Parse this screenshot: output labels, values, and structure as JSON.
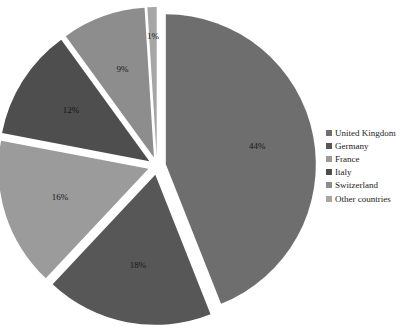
{
  "chart_data": {
    "type": "pie",
    "title": "",
    "xlabel": "",
    "ylabel": "",
    "legend_position": "right",
    "exploded": true,
    "categories": [
      "United Kingdom",
      "Germany",
      "France",
      "Italy",
      "Switzerland",
      "Other countries"
    ],
    "values": [
      44,
      18,
      16,
      12,
      9,
      1
    ],
    "data_labels": [
      "44%",
      "18%",
      "16%",
      "12%",
      "9%",
      "1%"
    ],
    "units": "percent",
    "colors": [
      "#6e6e6e",
      "#575757",
      "#9b9b9b",
      "#4e4e4e",
      "#8d8d8d",
      "#a6a6a6"
    ],
    "slices": [
      {
        "label": "United Kingdom",
        "value": 44,
        "data_label": "44%",
        "color": "#6e6e6e"
      },
      {
        "label": "Germany",
        "value": 18,
        "data_label": "18%",
        "color": "#575757"
      },
      {
        "label": "France",
        "value": 16,
        "data_label": "16%",
        "color": "#9b9b9b"
      },
      {
        "label": "Italy",
        "value": 12,
        "data_label": "12%",
        "color": "#4e4e4e"
      },
      {
        "label": "Switzerland",
        "value": 9,
        "data_label": "9%",
        "color": "#8d8d8d"
      },
      {
        "label": "Other countries",
        "value": 1,
        "data_label": "1%",
        "color": "#a6a6a6"
      }
    ]
  },
  "legend": {
    "items": [
      {
        "label": "United Kingdom",
        "color": "#6e6e6e"
      },
      {
        "label": "Germany",
        "color": "#575757"
      },
      {
        "label": "France",
        "color": "#9b9b9b"
      },
      {
        "label": "Italy",
        "color": "#4e4e4e"
      },
      {
        "label": "Switzerland",
        "color": "#8d8d8d"
      },
      {
        "label": "Other countries",
        "color": "#a6a6a6"
      }
    ]
  },
  "title_remnant": {
    "text": "——— —— ———— —————"
  }
}
